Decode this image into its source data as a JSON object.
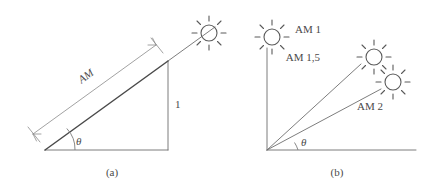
{
  "figure": {
    "background_color": "#ffffff",
    "line_color": "#4a4a4a",
    "thin_line_color": "#7a7a7a",
    "panels": [
      {
        "id": "panel-a",
        "caption": "(a)",
        "labels": {
          "hypotenuse": "AM",
          "vertical_side": "1",
          "angle": "θ"
        },
        "icons": [
          {
            "name": "sun-icon",
            "label": ""
          }
        ]
      },
      {
        "id": "panel-b",
        "caption": "(b)",
        "labels": {
          "angle": "θ",
          "am1": "AM 1",
          "am15": "AM 1,5",
          "am2": "AM 2"
        },
        "icons": [
          {
            "name": "sun-icon-am1",
            "label": "AM 1"
          },
          {
            "name": "sun-icon-am15",
            "label": "AM 1,5"
          },
          {
            "name": "sun-icon-am2",
            "label": "AM 2"
          }
        ]
      }
    ]
  }
}
